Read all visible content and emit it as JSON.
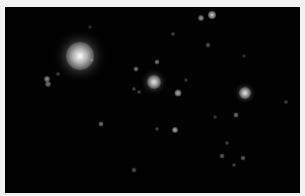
{
  "image": {
    "subject": "star field night sky",
    "background_color": "#020202",
    "border_color": "#f2f2f2"
  },
  "stars": [
    {
      "x": 80,
      "y": 56,
      "r": 13,
      "brightness": 1.0
    },
    {
      "x": 154,
      "y": 82,
      "r": 6,
      "brightness": 0.9
    },
    {
      "x": 245,
      "y": 93,
      "r": 5,
      "brightness": 0.9
    },
    {
      "x": 212,
      "y": 15,
      "r": 3,
      "brightness": 0.8
    },
    {
      "x": 201,
      "y": 18,
      "r": 2,
      "brightness": 0.6
    },
    {
      "x": 178,
      "y": 93,
      "r": 2.5,
      "brightness": 0.7
    },
    {
      "x": 175,
      "y": 130,
      "r": 2,
      "brightness": 0.7
    },
    {
      "x": 47,
      "y": 79,
      "r": 2,
      "brightness": 0.6
    },
    {
      "x": 48,
      "y": 84,
      "r": 2,
      "brightness": 0.5
    },
    {
      "x": 136,
      "y": 69,
      "r": 1.5,
      "brightness": 0.5
    },
    {
      "x": 157,
      "y": 62,
      "r": 1.5,
      "brightness": 0.5
    },
    {
      "x": 101,
      "y": 124,
      "r": 1.5,
      "brightness": 0.5
    },
    {
      "x": 236,
      "y": 115,
      "r": 1.5,
      "brightness": 0.5
    },
    {
      "x": 222,
      "y": 156,
      "r": 1.5,
      "brightness": 0.4
    },
    {
      "x": 243,
      "y": 158,
      "r": 1.5,
      "brightness": 0.4
    },
    {
      "x": 134,
      "y": 170,
      "r": 1.5,
      "brightness": 0.35
    },
    {
      "x": 208,
      "y": 45,
      "r": 1.5,
      "brightness": 0.35
    },
    {
      "x": 286,
      "y": 102,
      "r": 1,
      "brightness": 0.3
    },
    {
      "x": 173,
      "y": 34,
      "r": 1,
      "brightness": 0.3
    },
    {
      "x": 58,
      "y": 74,
      "r": 1,
      "brightness": 0.3
    },
    {
      "x": 134,
      "y": 89,
      "r": 1,
      "brightness": 0.3
    },
    {
      "x": 139,
      "y": 92,
      "r": 1,
      "brightness": 0.3
    },
    {
      "x": 227,
      "y": 143,
      "r": 1,
      "brightness": 0.3
    },
    {
      "x": 234,
      "y": 165,
      "r": 1,
      "brightness": 0.3
    },
    {
      "x": 157,
      "y": 129,
      "r": 1,
      "brightness": 0.3
    },
    {
      "x": 92,
      "y": 60,
      "r": 1,
      "brightness": 0.25
    },
    {
      "x": 186,
      "y": 80,
      "r": 1,
      "brightness": 0.25
    },
    {
      "x": 215,
      "y": 117,
      "r": 1,
      "brightness": 0.25
    },
    {
      "x": 90,
      "y": 27,
      "r": 1,
      "brightness": 0.2
    },
    {
      "x": 244,
      "y": 56,
      "r": 1,
      "brightness": 0.2
    }
  ]
}
